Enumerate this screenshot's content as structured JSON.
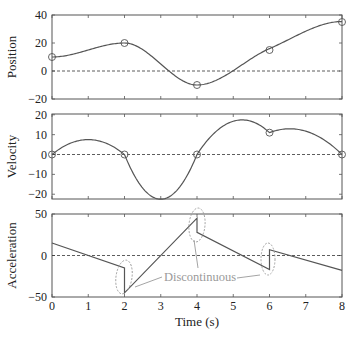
{
  "chart_data": [
    {
      "type": "line",
      "ylabel": "Position",
      "xlabel": "",
      "xlim": [
        0,
        8
      ],
      "ylim": [
        -20,
        40
      ],
      "yticks": [
        -20,
        0,
        20,
        40
      ],
      "ytick_labels": [
        "−20",
        "0",
        "20",
        "40"
      ],
      "markers": [
        {
          "x": 0,
          "y": 10
        },
        {
          "x": 2,
          "y": 20
        },
        {
          "x": 4,
          "y": -10
        },
        {
          "x": 6,
          "y": 15
        },
        {
          "x": 8,
          "y": 35
        }
      ],
      "zero_line": "dashed"
    },
    {
      "type": "line",
      "ylabel": "Velocity",
      "xlabel": "",
      "xlim": [
        0,
        8
      ],
      "ylim": [
        -22,
        20
      ],
      "yticks": [
        -20,
        -10,
        0,
        10,
        20
      ],
      "ytick_labels": [
        "−20",
        "−10",
        "0",
        "10",
        "20"
      ],
      "markers": [
        {
          "x": 0,
          "y": 0
        },
        {
          "x": 2,
          "y": 0
        },
        {
          "x": 4,
          "y": 0
        },
        {
          "x": 6,
          "y": 11
        },
        {
          "x": 8,
          "y": 0
        }
      ],
      "zero_line": "dashed"
    },
    {
      "type": "line",
      "ylabel": "Acceleration",
      "xlabel": "Time (s)",
      "xlim": [
        0,
        8
      ],
      "ylim": [
        -50,
        50
      ],
      "yticks": [
        -50,
        0,
        50
      ],
      "ytick_labels": [
        "−50",
        "0",
        "50"
      ],
      "xticks": [
        0,
        1,
        2,
        3,
        4,
        5,
        6,
        7,
        8
      ],
      "xtick_labels": [
        "0",
        "1",
        "2",
        "3",
        "4",
        "5",
        "6",
        "7",
        "8"
      ],
      "segments": [
        {
          "t0": 0,
          "t1": 2,
          "a0": 15,
          "a1": -15
        },
        {
          "t0": 2,
          "t1": 4,
          "a0": -45,
          "a1": 45
        },
        {
          "t0": 4,
          "t1": 6,
          "a0": 28,
          "a1": -17
        },
        {
          "t0": 6,
          "t1": 8,
          "a0": 7,
          "a1": -18
        }
      ],
      "initial_position": 10,
      "initial_velocity": 0,
      "annotation": {
        "text": "Discontinuous",
        "points_at_t": [
          2,
          4,
          6
        ]
      },
      "zero_line": "dashed"
    }
  ],
  "colors": {
    "curve": "#555555",
    "axes": "#555555",
    "annotation": "#9a9a9a"
  }
}
